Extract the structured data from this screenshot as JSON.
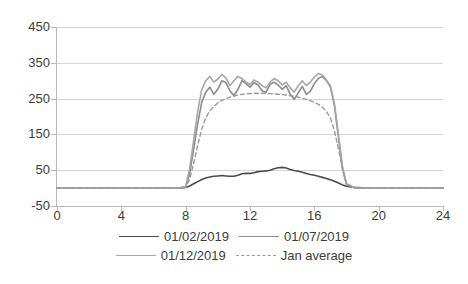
{
  "chart_data": {
    "type": "line",
    "title": "",
    "xlabel": "",
    "ylabel": "",
    "xlim": [
      0,
      24
    ],
    "ylim": [
      -50,
      450
    ],
    "xticks": [
      0,
      4,
      8,
      12,
      16,
      20,
      24
    ],
    "yticks": [
      -50,
      50,
      150,
      250,
      350,
      450
    ],
    "grid": true,
    "legend_position": "bottom",
    "x": [
      0,
      0.5,
      1,
      1.5,
      2,
      2.5,
      3,
      3.5,
      4,
      4.5,
      5,
      5.5,
      6,
      6.5,
      7,
      7.5,
      8,
      8.25,
      8.5,
      8.75,
      9,
      9.25,
      9.5,
      9.75,
      10,
      10.25,
      10.5,
      10.75,
      11,
      11.25,
      11.5,
      11.75,
      12,
      12.25,
      12.5,
      12.75,
      13,
      13.25,
      13.5,
      13.75,
      14,
      14.25,
      14.5,
      14.75,
      15,
      15.25,
      15.5,
      15.75,
      16,
      16.25,
      16.5,
      16.75,
      17,
      17.25,
      17.5,
      17.75,
      18,
      18.5,
      19,
      20,
      21,
      22,
      23,
      24
    ],
    "series": [
      {
        "name": "01/02/2019",
        "color": "#4a4a4a",
        "style": "solid",
        "values": [
          0,
          0,
          0,
          0,
          0,
          0,
          0,
          0,
          0,
          0,
          0,
          0,
          0,
          0,
          0,
          0,
          2,
          6,
          12,
          18,
          24,
          28,
          31,
          33,
          34,
          35,
          34,
          33,
          33,
          36,
          40,
          41,
          41,
          43,
          46,
          47,
          48,
          50,
          54,
          57,
          58,
          56,
          52,
          49,
          47,
          44,
          41,
          38,
          36,
          33,
          30,
          27,
          23,
          19,
          14,
          9,
          5,
          2,
          1,
          0,
          0,
          0,
          0,
          0
        ]
      },
      {
        "name": "01/07/2019",
        "color": "#8c8c8c",
        "style": "solid",
        "values": [
          0,
          0,
          0,
          0,
          0,
          0,
          0,
          0,
          0,
          0,
          0,
          0,
          0,
          0,
          0,
          0,
          3,
          40,
          110,
          180,
          240,
          268,
          282,
          262,
          276,
          300,
          295,
          272,
          258,
          276,
          300,
          292,
          282,
          295,
          288,
          272,
          268,
          290,
          296,
          288,
          276,
          286,
          262,
          248,
          266,
          284,
          262,
          270,
          292,
          306,
          312,
          300,
          282,
          230,
          140,
          55,
          10,
          1,
          0,
          0,
          0,
          0,
          0,
          0
        ]
      },
      {
        "name": "01/12/2019",
        "color": "#a8a8a8",
        "style": "solid",
        "values": [
          0,
          0,
          0,
          0,
          0,
          0,
          0,
          0,
          0,
          0,
          0,
          0,
          0,
          0,
          0,
          0,
          4,
          55,
          135,
          215,
          275,
          300,
          312,
          296,
          304,
          318,
          308,
          286,
          300,
          312,
          306,
          296,
          290,
          302,
          296,
          286,
          280,
          296,
          306,
          300,
          288,
          296,
          280,
          268,
          286,
          300,
          286,
          296,
          310,
          320,
          316,
          302,
          286,
          236,
          150,
          60,
          12,
          1,
          0,
          0,
          0,
          0,
          0,
          0
        ]
      },
      {
        "name": "Jan average",
        "color": "#9a9a9a",
        "style": "dashed",
        "values": [
          0,
          0,
          0,
          0,
          0,
          0,
          0,
          0,
          0,
          0,
          0,
          0,
          0,
          0,
          0,
          0,
          2,
          25,
          70,
          120,
          165,
          196,
          216,
          228,
          238,
          245,
          250,
          254,
          257,
          260,
          262,
          263,
          264,
          265,
          265,
          265,
          265,
          264,
          263,
          262,
          261,
          260,
          258,
          256,
          254,
          251,
          248,
          244,
          240,
          234,
          226,
          214,
          196,
          160,
          110,
          52,
          12,
          1,
          0,
          0,
          0,
          0,
          0,
          0
        ]
      }
    ]
  },
  "legend": {
    "rows": [
      [
        {
          "label": "01/02/2019",
          "series_index": 0
        },
        {
          "label": "01/07/2019",
          "series_index": 1
        }
      ],
      [
        {
          "label": "01/12/2019",
          "series_index": 2
        },
        {
          "label": "Jan average",
          "series_index": 3
        }
      ]
    ]
  }
}
